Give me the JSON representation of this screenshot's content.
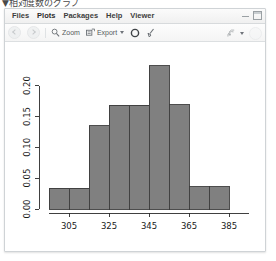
{
  "page": {
    "caption": "▼相対度数のグラフ"
  },
  "window": {
    "minimize_label": "minimize",
    "maximize_label": "maximize"
  },
  "tabs": [
    {
      "label": "Files",
      "active": false
    },
    {
      "label": "Plots",
      "active": true
    },
    {
      "label": "Packages",
      "active": false
    },
    {
      "label": "Help",
      "active": false
    },
    {
      "label": "Viewer",
      "active": false
    }
  ],
  "toolbar": {
    "back_icon": "back-arrow-icon",
    "forward_icon": "forward-arrow-icon",
    "zoom_label": "Zoom",
    "zoom_icon": "magnifier-icon",
    "export_label": "Export",
    "export_icon": "export-icon",
    "export_caret": "chevron-down-icon",
    "remove_icon": "remove-plot-icon",
    "clear_icon": "clear-all-plots-icon",
    "publish_icon": "publish-icon",
    "publish_caret": "chevron-down-icon",
    "refresh_icon": "refresh-icon"
  },
  "chart_data": {
    "type": "bar",
    "title": "",
    "xlabel": "",
    "ylabel": "",
    "xlim": [
      295,
      395
    ],
    "ylim": [
      0.0,
      0.235
    ],
    "grid": false,
    "legend": null,
    "bar_color": "#808080",
    "bar_edge_color": "#3a3a3a",
    "bin_width": 10,
    "bin_edges": [
      295,
      305,
      315,
      325,
      335,
      345,
      355,
      365,
      375,
      385
    ],
    "categories": [
      "295-305",
      "305-315",
      "315-325",
      "325-335",
      "335-345",
      "345-355",
      "355-365",
      "365-375",
      "375-385"
    ],
    "values": [
      0.034,
      0.034,
      0.135,
      0.168,
      0.168,
      0.232,
      0.169,
      0.036,
      0.036
    ],
    "xticks": [
      305,
      325,
      345,
      365,
      385
    ],
    "xtick_labels": [
      "305",
      "325",
      "345",
      "365",
      "385"
    ],
    "yticks": [
      0.0,
      0.05,
      0.1,
      0.15,
      0.2
    ],
    "ytick_labels": [
      "0.00",
      "0.05",
      "0.10",
      "0.15",
      "0.20"
    ]
  }
}
